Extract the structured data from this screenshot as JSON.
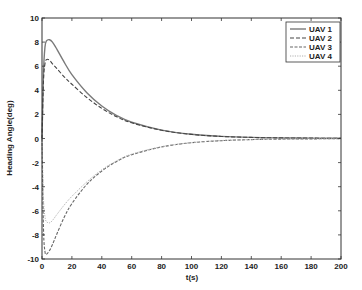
{
  "chart_data": {
    "type": "line",
    "title": "",
    "xlabel": "t(s)",
    "ylabel": "Heading Angle(deg)",
    "xlim": [
      0,
      200
    ],
    "ylim": [
      -10,
      10
    ],
    "xticks": [
      0,
      20,
      40,
      60,
      80,
      100,
      120,
      140,
      160,
      180,
      200
    ],
    "yticks": [
      -10,
      -8,
      -6,
      -4,
      -2,
      0,
      2,
      4,
      6,
      8,
      10
    ],
    "grid": false,
    "legend_position": "upper right",
    "x": [
      0,
      1,
      2,
      3,
      5,
      7,
      10,
      15,
      20,
      30,
      40,
      50,
      60,
      80,
      100,
      120,
      140,
      160,
      180,
      200
    ],
    "series": [
      {
        "name": "UAV 1",
        "style": "solid",
        "color": "#7a7a7a",
        "values": [
          0,
          5.5,
          7.6,
          8.1,
          8.2,
          8.0,
          7.4,
          6.3,
          5.3,
          3.8,
          2.7,
          1.9,
          1.35,
          0.7,
          0.35,
          0.18,
          0.09,
          0.05,
          0.03,
          0.02
        ]
      },
      {
        "name": "UAV 2",
        "style": "dashed",
        "color": "#444444",
        "values": [
          0,
          4.8,
          6.2,
          6.55,
          6.5,
          6.2,
          5.8,
          5.1,
          4.5,
          3.4,
          2.5,
          1.8,
          1.3,
          0.68,
          0.34,
          0.17,
          0.09,
          0.05,
          0.03,
          0.02
        ]
      },
      {
        "name": "UAV 3",
        "style": "dash-dot",
        "color": "#666666",
        "values": [
          0,
          -7.5,
          -9.4,
          -9.6,
          -9.3,
          -8.8,
          -7.9,
          -6.5,
          -5.4,
          -3.8,
          -2.7,
          -1.9,
          -1.35,
          -0.7,
          -0.35,
          -0.18,
          -0.09,
          -0.05,
          -0.03,
          -0.02
        ]
      },
      {
        "name": "UAV 4",
        "style": "dotted",
        "color": "#b0b0b0",
        "values": [
          0,
          -5.0,
          -6.5,
          -6.9,
          -7.0,
          -6.8,
          -6.3,
          -5.5,
          -4.8,
          -3.6,
          -2.6,
          -1.85,
          -1.3,
          -0.68,
          -0.34,
          -0.17,
          -0.09,
          -0.05,
          -0.03,
          -0.02
        ]
      }
    ]
  },
  "legend": {
    "items": [
      "UAV 1",
      "UAV 2",
      "UAV 3",
      "UAV 4"
    ]
  },
  "axes": {
    "xlabel": "t(s)",
    "ylabel": "Heading Angle(deg)"
  }
}
